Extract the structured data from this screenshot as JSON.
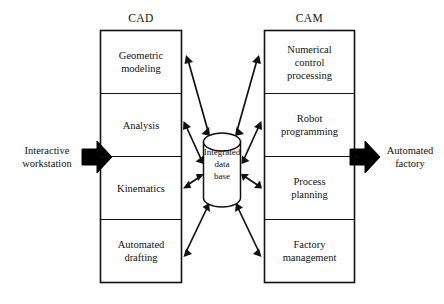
{
  "diagram": {
    "title_cad": "CAD",
    "title_cam": "CAM",
    "cad_cells": [
      {
        "line1": "Geometric",
        "line2": "modeling"
      },
      {
        "line1": "Analysis",
        "line2": ""
      },
      {
        "line1": "Kinematics",
        "line2": ""
      },
      {
        "line1": "Automated",
        "line2": "drafting"
      }
    ],
    "cam_cells": [
      {
        "line1": "Numerical",
        "line2": "control",
        "line3": "processing"
      },
      {
        "line1": "Robot",
        "line2": "programming",
        "line3": ""
      },
      {
        "line1": "Process",
        "line2": "planning",
        "line3": ""
      },
      {
        "line1": "Factory",
        "line2": "management",
        "line3": ""
      }
    ],
    "database": {
      "line1": "Integrated",
      "line2": "data",
      "line3": "base"
    },
    "input": {
      "line1": "Interactive",
      "line2": "workstation"
    },
    "output": {
      "line1": "Automated",
      "line2": "factory"
    },
    "colors": {
      "stroke": "#111111",
      "fill": "#ffffff",
      "background": "#ffffff",
      "bold_arrow": "#000000"
    }
  }
}
